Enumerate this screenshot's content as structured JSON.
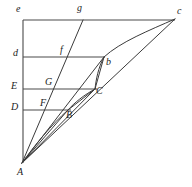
{
  "figure": {
    "background_color": "#ffffff",
    "stroke_color": "#3b3b3b",
    "label_color": "#1c1c1c",
    "width": 192,
    "height": 187
  },
  "labels": {
    "e": "e",
    "g": "g",
    "c": "c",
    "d": "d",
    "f": "f",
    "b": "b",
    "E": "E",
    "G": "G",
    "C": "C",
    "D": "D",
    "F": "F",
    "B": "B",
    "A": "A"
  },
  "points": {
    "A": {
      "x": 22,
      "y": 163,
      "label": "A"
    },
    "e": {
      "x": 23,
      "y": 20,
      "label": "e"
    },
    "d": {
      "x": 23,
      "y": 57,
      "label": "d"
    },
    "E": {
      "x": 23,
      "y": 89,
      "label": "E"
    },
    "D": {
      "x": 23,
      "y": 110,
      "label": "D"
    },
    "c": {
      "x": 175,
      "y": 19,
      "label": "c"
    },
    "b": {
      "x": 104,
      "y": 57,
      "label": "b"
    },
    "C": {
      "x": 95,
      "y": 89,
      "label": "C"
    },
    "B": {
      "x": 68,
      "y": 110,
      "label": "B"
    },
    "g": {
      "x": 83,
      "y": 20,
      "label": "g"
    },
    "f": {
      "x": 66,
      "y": 57,
      "label": "f"
    },
    "G": {
      "x": 50,
      "y": 89,
      "label": "G"
    },
    "F": {
      "x": 46,
      "y": 110,
      "label": "F"
    }
  },
  "label_positions": {
    "e": {
      "x": 16,
      "y": 5
    },
    "g": {
      "x": 78,
      "y": 5
    },
    "c": {
      "x": 177,
      "y": 7
    },
    "d": {
      "x": 14,
      "y": 50
    },
    "f": {
      "x": 61,
      "y": 47
    },
    "b": {
      "x": 106,
      "y": 58
    },
    "E": {
      "x": 13,
      "y": 82
    },
    "G": {
      "x": 46,
      "y": 79
    },
    "C": {
      "x": 96,
      "y": 88
    },
    "D": {
      "x": 13,
      "y": 103
    },
    "F": {
      "x": 41,
      "y": 100
    },
    "B": {
      "x": 67,
      "y": 110
    },
    "A": {
      "x": 18,
      "y": 168
    }
  },
  "horizontal_lines": [
    {
      "name": "line-e-c",
      "y": 20,
      "x1": 23,
      "x2": 175
    },
    {
      "name": "line-d-b",
      "y": 57,
      "x1": 23,
      "x2": 104
    },
    {
      "name": "line-E-C",
      "y": 89,
      "x1": 23,
      "x2": 96
    },
    {
      "name": "line-D-B",
      "y": 110,
      "x1": 23,
      "x2": 70
    }
  ],
  "vertical_axis": {
    "name": "axis-e-A",
    "x": 23,
    "y1": 20,
    "y2": 163
  },
  "rays": [
    {
      "name": "ray-A-c",
      "from": "A",
      "to": "c"
    },
    {
      "name": "ray-A-b",
      "from": "A",
      "to": "b"
    },
    {
      "name": "ray-A-C",
      "from": "A",
      "to": "C"
    },
    {
      "name": "ray-A-B",
      "from": "A",
      "to": "B"
    },
    {
      "name": "ray-A-g",
      "from": "A",
      "to": "g"
    }
  ],
  "curves": [
    {
      "name": "curve-c-b",
      "from": "c",
      "to": "b"
    },
    {
      "name": "curve-b-C",
      "from": "b",
      "to": "C"
    },
    {
      "name": "curve-C-B",
      "from": "C",
      "to": "B"
    },
    {
      "name": "curve-B-A",
      "from": "B",
      "to": "A"
    }
  ]
}
